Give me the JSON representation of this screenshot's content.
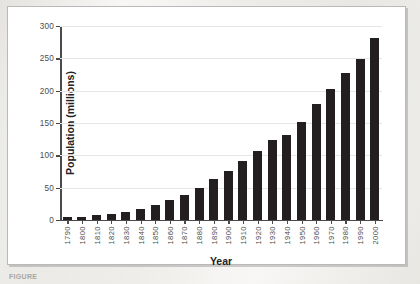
{
  "figure": {
    "caption": "FIGURE",
    "frame_color": "#b9b9b9",
    "bar_color": "#231f20",
    "grid_color": "#e6e6e6",
    "axis_color": "#4a4a4a"
  },
  "chart_data": {
    "type": "bar",
    "title": "",
    "xlabel": "Year",
    "ylabel": "Population (millions)",
    "categories": [
      "1790",
      "1800",
      "1810",
      "1820",
      "1830",
      "1840",
      "1850",
      "1860",
      "1870",
      "1880",
      "1890",
      "1900",
      "1910",
      "1920",
      "1930",
      "1940",
      "1950",
      "1960",
      "1970",
      "1980",
      "1990",
      "2000"
    ],
    "values": [
      4,
      5,
      7,
      10,
      13,
      17,
      23,
      31,
      39,
      50,
      63,
      76,
      92,
      106,
      123,
      132,
      151,
      179,
      203,
      227,
      249,
      281
    ],
    "ylim": [
      0,
      300
    ],
    "yticks": [
      0,
      50,
      100,
      150,
      200,
      250,
      300
    ],
    "ytick_labels": [
      "0",
      "50",
      "100",
      "150",
      "200",
      "250",
      "300"
    ],
    "grid": "horizontal",
    "legend": "none"
  }
}
